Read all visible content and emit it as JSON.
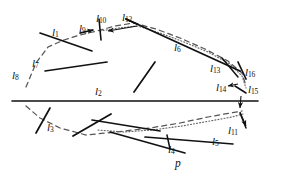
{
  "figure": {
    "ink_color": "#111111",
    "dash_color": "#555555",
    "dot_color": "#666666",
    "background": "#ffffff",
    "width": 284,
    "height": 182
  },
  "labels": [
    {
      "id": "l1",
      "base": "l",
      "sub": "1",
      "x": 52,
      "y": 27
    },
    {
      "id": "l2",
      "base": "l",
      "sub": "2",
      "x": 95,
      "y": 86
    },
    {
      "id": "l3",
      "base": "l",
      "sub": "3",
      "x": 47,
      "y": 122
    },
    {
      "id": "l4",
      "base": "l",
      "sub": "4",
      "x": 168,
      "y": 144
    },
    {
      "id": "l5",
      "base": "l",
      "sub": "5",
      "x": 212,
      "y": 136
    },
    {
      "id": "l6",
      "base": "l",
      "sub": "6",
      "x": 174,
      "y": 42
    },
    {
      "id": "l7",
      "base": "l",
      "sub": "7",
      "x": 32,
      "y": 58
    },
    {
      "id": "l8",
      "base": "l",
      "sub": "8",
      "x": 12,
      "y": 70
    },
    {
      "id": "l9",
      "base": "l",
      "sub": "9",
      "x": 79,
      "y": 23
    },
    {
      "id": "l10",
      "base": "l",
      "sub": "10",
      "x": 96,
      "y": 13
    },
    {
      "id": "l11",
      "base": "l",
      "sub": "11",
      "x": 228,
      "y": 125
    },
    {
      "id": "l12",
      "base": "l",
      "sub": "12",
      "x": 122,
      "y": 12
    },
    {
      "id": "l13",
      "base": "l",
      "sub": "13",
      "x": 210,
      "y": 63
    },
    {
      "id": "l14",
      "base": "l",
      "sub": "14",
      "x": 216,
      "y": 82
    },
    {
      "id": "l15",
      "base": "l",
      "sub": "15",
      "x": 248,
      "y": 84
    },
    {
      "id": "l16",
      "base": "l",
      "sub": "16",
      "x": 245,
      "y": 67
    },
    {
      "id": "p",
      "base": "p",
      "sub": "",
      "x": 175,
      "y": 158
    }
  ],
  "solid_segments": [
    {
      "name": "line-l2-main",
      "x1": 12,
      "y1": 101,
      "x2": 258,
      "y2": 101,
      "w": 1.6
    },
    {
      "name": "line-l1",
      "x1": 40,
      "y1": 33,
      "x2": 92,
      "y2": 51,
      "w": 1.7
    },
    {
      "name": "line-l7",
      "x1": 45,
      "y1": 71,
      "x2": 107,
      "y2": 62,
      "w": 1.7
    },
    {
      "name": "line-l9",
      "x1": 80,
      "y1": 33,
      "x2": 93,
      "y2": 30,
      "w": 1.7
    },
    {
      "name": "line-l10",
      "x1": 99,
      "y1": 19,
      "x2": 101,
      "y2": 40,
      "w": 1.6
    },
    {
      "name": "line-l12-top",
      "x1": 126,
      "y1": 19,
      "x2": 240,
      "y2": 71,
      "w": 1.9
    },
    {
      "name": "line-l12-hook",
      "x1": 126,
      "y1": 19,
      "x2": 137,
      "y2": 24,
      "w": 1.7
    },
    {
      "name": "line-l16",
      "x1": 238,
      "y1": 62,
      "x2": 246,
      "y2": 79,
      "w": 1.7
    },
    {
      "name": "line-l13",
      "x1": 222,
      "y1": 58,
      "x2": 238,
      "y2": 77,
      "w": 1.5
    },
    {
      "name": "line-l15",
      "x1": 235,
      "y1": 86,
      "x2": 246,
      "y2": 93,
      "w": 1.5
    },
    {
      "name": "line-middle",
      "x1": 134,
      "y1": 92,
      "x2": 155,
      "y2": 62,
      "w": 1.7
    },
    {
      "name": "line-l3",
      "x1": 36,
      "y1": 133,
      "x2": 50,
      "y2": 108,
      "w": 1.7
    },
    {
      "name": "line-cross-a",
      "x1": 73,
      "y1": 136,
      "x2": 111,
      "y2": 114,
      "w": 1.8
    },
    {
      "name": "line-cross-b",
      "x1": 92,
      "y1": 120,
      "x2": 160,
      "y2": 131,
      "w": 1.7
    },
    {
      "name": "line-l4",
      "x1": 110,
      "y1": 132,
      "x2": 185,
      "y2": 153,
      "w": 1.7
    },
    {
      "name": "line-l4-tick",
      "x1": 167,
      "y1": 135,
      "x2": 170,
      "y2": 149,
      "w": 1.5
    },
    {
      "name": "line-l5",
      "x1": 145,
      "y1": 137,
      "x2": 233,
      "y2": 144,
      "w": 1.7
    },
    {
      "name": "line-l11-tip",
      "x1": 240,
      "y1": 113,
      "x2": 246,
      "y2": 128,
      "w": 1.5
    }
  ],
  "dashed_curve": {
    "name": "upper-dashed-boundary",
    "points": "26,87 36,63 48,47 64,40 80,35 97,31 115,26 134,23 156,29 180,38 205,49 228,61 242,73 246,86"
  },
  "dashed_curve_lower": {
    "name": "lower-dashed-boundary",
    "points": "26,106 40,118 60,128 86,135 116,132 150,128 180,123 208,117 230,113 242,111"
  },
  "dotted_curve": {
    "name": "upper-dotted-boundary",
    "points": "100,31 118,28 138,26 160,33 184,42 208,52 230,64 242,76 246,88"
  },
  "dotted_curve_lower": {
    "name": "lower-dotted-boundary",
    "points": "98,130 124,132 152,130 182,126 210,121 232,117 243,114"
  },
  "arrows": [
    {
      "name": "arrow-l9",
      "x1": 80,
      "y1": 33,
      "x2": 93,
      "y2": 30
    },
    {
      "name": "arrow-l12",
      "x1": 137,
      "y1": 26,
      "x2": 108,
      "y2": 31
    },
    {
      "name": "arrow-l14",
      "x1": 238,
      "y1": 84,
      "x2": 228,
      "y2": 86
    },
    {
      "name": "arrow-l11",
      "x1": 240,
      "y1": 112,
      "x2": 246,
      "y2": 126
    },
    {
      "name": "arrow-l15",
      "x1": 241,
      "y1": 96,
      "x2": 240,
      "y2": 108
    }
  ]
}
